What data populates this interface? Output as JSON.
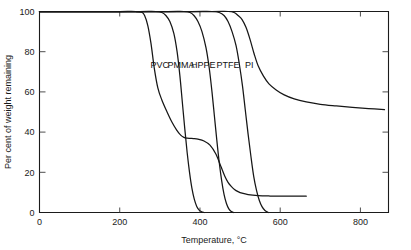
{
  "chart_data": {
    "type": "line",
    "title": "",
    "xlabel": "Temperature, °C",
    "ylabel": "Per cent of weight remaining",
    "xlim": [
      0,
      870
    ],
    "ylim": [
      0,
      100
    ],
    "xticks": [
      0,
      200,
      400,
      600,
      800
    ],
    "yticks": [
      0,
      20,
      40,
      60,
      80,
      100
    ],
    "xticklabels": [
      "0",
      "200",
      "400",
      "600",
      "800"
    ],
    "yticklabels": [
      "0",
      "20",
      "40",
      "60",
      "80",
      "100"
    ],
    "grid": false,
    "legend": "inline-labels",
    "legend_position": "inside-plot-upper-middle",
    "series": [
      {
        "name": "PVC",
        "label": "PVC",
        "label_x": 300,
        "label_y": 72,
        "color": "#161616",
        "x": [
          0,
          120,
          200,
          240,
          255,
          262,
          270,
          278,
          286,
          295,
          305,
          318,
          330,
          342,
          352,
          360,
          368,
          376,
          384,
          395,
          410,
          425,
          440,
          452,
          462,
          470,
          478,
          486,
          495,
          505,
          520,
          545,
          575,
          610,
          640,
          665
        ],
        "y": [
          100,
          100,
          100,
          100,
          99.6,
          98,
          93,
          84,
          72,
          62,
          56,
          50,
          45,
          41,
          38.5,
          37.4,
          37,
          36.9,
          36.8,
          36.5,
          35.6,
          33.5,
          29,
          23,
          18,
          15,
          13,
          11.5,
          10.4,
          9.6,
          8.9,
          8.4,
          8.2,
          8.1,
          8.1,
          8.1
        ]
      },
      {
        "name": "PMMA",
        "label": "PMMA",
        "label_x": 353,
        "label_y": 72,
        "color": "#161616",
        "x": [
          0,
          150,
          250,
          290,
          305,
          315,
          325,
          335,
          343,
          350,
          356,
          362,
          368,
          374,
          380,
          386,
          392,
          398,
          404,
          410
        ],
        "y": [
          100,
          100,
          100,
          100,
          99.5,
          98,
          95,
          89,
          80,
          68,
          55,
          42,
          30,
          20,
          12,
          6.5,
          3,
          1.2,
          0.4,
          0
        ]
      },
      {
        "name": "HPPE",
        "label": "HPPE",
        "label_x": 408,
        "label_y": 72,
        "color": "#161616",
        "x": [
          0,
          200,
          320,
          360,
          375,
          385,
          395,
          405,
          415,
          423,
          430,
          436,
          442,
          448,
          454,
          460,
          466,
          472,
          478,
          484
        ],
        "y": [
          100,
          100,
          100,
          100,
          99.5,
          98,
          95,
          90,
          82,
          72,
          60,
          48,
          36,
          25,
          16,
          9,
          4.5,
          1.8,
          0.5,
          0
        ]
      },
      {
        "name": "PTFE",
        "label": "PTFE",
        "label_x": 470,
        "label_y": 72,
        "color": "#161616",
        "x": [
          0,
          250,
          380,
          430,
          448,
          460,
          470,
          480,
          490,
          498,
          506,
          513,
          520,
          527,
          534,
          541,
          548,
          555,
          562,
          570
        ],
        "y": [
          100,
          100,
          100,
          100,
          99.5,
          98,
          95,
          90,
          83,
          74,
          63,
          51,
          39,
          28,
          18,
          11,
          6,
          2.8,
          1,
          0
        ]
      },
      {
        "name": "PI",
        "label": "PI",
        "label_x": 523,
        "label_y": 72,
        "color": "#161616",
        "x": [
          0,
          300,
          430,
          470,
          485,
          495,
          505,
          515,
          525,
          535,
          545,
          558,
          572,
          590,
          610,
          635,
          665,
          700,
          740,
          780,
          820,
          860
        ],
        "y": [
          100,
          100,
          100,
          100,
          99.5,
          98,
          96,
          92,
          86,
          79,
          73,
          68,
          64,
          61,
          58.5,
          56.5,
          55,
          53.8,
          53,
          52.3,
          51.7,
          51.2
        ]
      }
    ],
    "notes": {
      "pvc_plateau_percent": 37,
      "pvc_residue_percent": 8,
      "pi_residue_percent": 51,
      "zero_residue_series": [
        "PMMA",
        "HPPE",
        "PTFE"
      ]
    }
  }
}
